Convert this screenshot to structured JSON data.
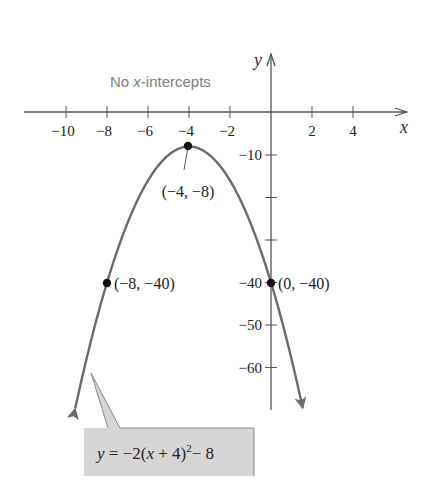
{
  "chart_data": {
    "type": "line",
    "title": "",
    "equation": "y = −2(x + 4)² − 8",
    "equation_parts": {
      "lhs": "y",
      "eq": " = −2(",
      "x": "x",
      "mid": " + 4)",
      "sup": "2",
      "tail": "− 8"
    },
    "annotation": {
      "prefix": "No ",
      "x": "x",
      "suffix": "-intercepts"
    },
    "xlabel": "x",
    "ylabel": "y",
    "xlim": [
      -11.5,
      6.5
    ],
    "ylim": [
      -70,
      14
    ],
    "x_ticks": [
      -10,
      -8,
      -6,
      -4,
      -2,
      2,
      4
    ],
    "x_tick_labels": [
      "−10",
      "−8",
      "−6",
      "−4",
      "−2",
      "2",
      "4"
    ],
    "y_ticks": [
      -10,
      -20,
      -30,
      -40,
      -50,
      -60
    ],
    "y_tick_labels": [
      "−10",
      "",
      "",
      "−40",
      "−50",
      "−60"
    ],
    "grid": false,
    "series": [
      {
        "name": "y = −2(x + 4)² − 8",
        "function": "-2*(x+4)^2-8",
        "x_range": [
          -9.55,
          1.55
        ],
        "color": "#6b6b6b"
      }
    ],
    "points": [
      {
        "x": -4,
        "y": -8,
        "label": "(−4, −8)",
        "role": "vertex"
      },
      {
        "x": -8,
        "y": -40,
        "label": "(−8, −40)"
      },
      {
        "x": 0,
        "y": -40,
        "label": "(0, −40)",
        "role": "y-intercept"
      }
    ],
    "colors": {
      "curve": "#6b6b6b",
      "axis": "#555555",
      "callout_fill": "#d6d6d6",
      "callout_border": "#8a8a8a",
      "note": "#808080"
    }
  }
}
